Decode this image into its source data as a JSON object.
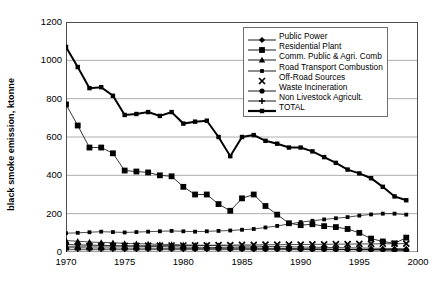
{
  "chart_data": {
    "type": "line",
    "title": "",
    "xlabel": "",
    "ylabel": "black smoke emission, ktonne",
    "xlim": [
      1970,
      2000
    ],
    "ylim": [
      0,
      1200
    ],
    "yticks": [
      0,
      200,
      400,
      600,
      800,
      1000,
      1200
    ],
    "xticks": [
      1970,
      1975,
      1980,
      1985,
      1990,
      1995,
      2000
    ],
    "grid": "horizontal",
    "legend_position": "top-right",
    "x": [
      1970,
      1971,
      1972,
      1973,
      1974,
      1975,
      1976,
      1977,
      1978,
      1979,
      1980,
      1981,
      1982,
      1983,
      1984,
      1985,
      1986,
      1987,
      1988,
      1989,
      1990,
      1991,
      1992,
      1993,
      1994,
      1995,
      1996,
      1997,
      1998,
      1999
    ],
    "series": [
      {
        "name": "Public Power",
        "marker": "diamond",
        "values": [
          40,
          38,
          36,
          35,
          33,
          31,
          30,
          29,
          28,
          27,
          26,
          25,
          24,
          23,
          22,
          22,
          21,
          20,
          19,
          18,
          17,
          16,
          15,
          14,
          13,
          12,
          11,
          10,
          9,
          8
        ]
      },
      {
        "name": "Residential Plant",
        "marker": "square",
        "values": [
          770,
          660,
          545,
          545,
          515,
          425,
          420,
          415,
          400,
          395,
          340,
          300,
          300,
          250,
          215,
          280,
          300,
          240,
          195,
          150,
          140,
          145,
          135,
          130,
          120,
          100,
          70,
          55,
          45,
          75
        ]
      },
      {
        "name": "Comm. Public & Agri. Comb",
        "marker": "triangle",
        "values": [
          60,
          56,
          52,
          50,
          48,
          45,
          43,
          42,
          40,
          39,
          37,
          35,
          34,
          33,
          32,
          31,
          30,
          29,
          28,
          27,
          26,
          25,
          24,
          23,
          22,
          21,
          20,
          19,
          18,
          17
        ]
      },
      {
        "name": "Road Transport Combustion",
        "marker": "small-square",
        "values": [
          98,
          100,
          103,
          106,
          104,
          102,
          104,
          106,
          108,
          110,
          108,
          106,
          108,
          110,
          112,
          116,
          120,
          128,
          136,
          146,
          156,
          163,
          170,
          176,
          182,
          190,
          196,
          200,
          200,
          195
        ]
      },
      {
        "name": "Off-Road Sources",
        "marker": "x",
        "values": [
          30,
          30,
          31,
          31,
          31,
          32,
          32,
          33,
          33,
          34,
          34,
          35,
          35,
          36,
          36,
          37,
          37,
          38,
          38,
          39,
          39,
          40,
          40,
          41,
          41,
          42,
          42,
          43,
          43,
          44
        ]
      },
      {
        "name": "Waste Incineration",
        "marker": "dot",
        "values": [
          22,
          22,
          21,
          21,
          21,
          20,
          20,
          20,
          19,
          19,
          19,
          18,
          18,
          18,
          17,
          17,
          17,
          16,
          16,
          16,
          15,
          15,
          15,
          14,
          14,
          14,
          13,
          13,
          12,
          12
        ]
      },
      {
        "name": "Non Livestock Agricult.",
        "marker": "plus",
        "values": [
          12,
          12,
          12,
          12,
          12,
          12,
          12,
          12,
          12,
          12,
          12,
          12,
          12,
          12,
          12,
          12,
          12,
          12,
          12,
          12,
          12,
          12,
          12,
          12,
          12,
          12,
          12,
          12,
          12,
          12
        ]
      },
      {
        "name": "TOTAL",
        "marker": "square-bold",
        "values": [
          1070,
          965,
          855,
          860,
          815,
          715,
          720,
          730,
          710,
          730,
          670,
          680,
          685,
          600,
          500,
          600,
          610,
          580,
          565,
          545,
          545,
          525,
          495,
          465,
          430,
          410,
          385,
          340,
          290,
          270
        ]
      }
    ]
  }
}
